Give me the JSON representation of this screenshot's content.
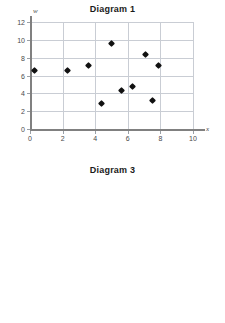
{
  "page": {
    "background": "#ffffff",
    "point_color": "#111111",
    "grid_color": "#c9cdd4",
    "axis_color": "#808080",
    "label_color": "#4a4a4a"
  },
  "charts": [
    {
      "id": "chart1",
      "title": "Diagram 1",
      "xlabel": "x",
      "ylabel": "w",
      "xticks": [
        "0",
        "2",
        "4",
        "6",
        "8",
        "10"
      ],
      "yticks": [
        "0",
        "2",
        "4",
        "6",
        "8",
        "10",
        "12"
      ]
    },
    {
      "id": "chart3",
      "title": "Diagram 3",
      "xlabel": "x",
      "ylabel": "w",
      "xticks": [
        "0",
        "2",
        "4",
        "6",
        "8",
        "10",
        "12"
      ],
      "yticks": [
        "0",
        "1",
        "2",
        "3",
        "4",
        "5",
        "6",
        "7",
        "8",
        "9"
      ]
    }
  ],
  "chart_data": [
    {
      "type": "scatter",
      "title": "Diagram 1",
      "xlabel": "x",
      "ylabel": "w",
      "xlim": [
        0,
        10
      ],
      "ylim": [
        0,
        12
      ],
      "xticks": [
        0,
        2,
        4,
        6,
        8,
        10
      ],
      "yticks": [
        0,
        2,
        4,
        6,
        8,
        10,
        12
      ],
      "grid": true,
      "legend": "none",
      "marker": "diamond",
      "points": [
        {
          "x": 0.3,
          "y": 6.6
        },
        {
          "x": 2.3,
          "y": 6.6
        },
        {
          "x": 3.6,
          "y": 7.1
        },
        {
          "x": 4.4,
          "y": 2.85
        },
        {
          "x": 5.0,
          "y": 9.6
        },
        {
          "x": 5.6,
          "y": 4.35
        },
        {
          "x": 6.3,
          "y": 4.75
        },
        {
          "x": 7.1,
          "y": 8.4
        },
        {
          "x": 7.5,
          "y": 3.2
        },
        {
          "x": 7.9,
          "y": 7.1
        }
      ]
    },
    {
      "type": "scatter",
      "title": "Diagram 3",
      "xlabel": "x",
      "ylabel": "w",
      "xlim": [
        0,
        12
      ],
      "ylim": [
        0,
        9
      ],
      "xticks": [
        0,
        2,
        4,
        6,
        8,
        10,
        12
      ],
      "yticks": [
        0,
        1,
        2,
        3,
        4,
        5,
        6,
        7,
        8,
        9
      ],
      "grid": true,
      "legend": "none",
      "marker": "diamond",
      "points": [
        {
          "x": 1.75,
          "y": 2.15
        },
        {
          "x": 2.1,
          "y": 2.0
        },
        {
          "x": 3.7,
          "y": 3.9
        },
        {
          "x": 4.4,
          "y": 3.75
        },
        {
          "x": 5.9,
          "y": 4.45
        },
        {
          "x": 6.15,
          "y": 3.2
        },
        {
          "x": 8.0,
          "y": 7.8
        },
        {
          "x": 8.05,
          "y": 7.05
        },
        {
          "x": 9.75,
          "y": 5.5
        },
        {
          "x": 10.8,
          "y": 5.0
        }
      ]
    }
  ]
}
